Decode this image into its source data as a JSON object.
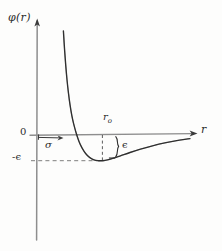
{
  "figure": {
    "kind": "hand-drawn-plot",
    "background_color": "#fdfdfc",
    "ink_color": "#2b2b2b",
    "axis_color": "#8a8a8a"
  },
  "labels": {
    "y_axis": "φ(r)",
    "x_axis": "r",
    "origin": "0",
    "sigma": "σ",
    "r_zero": "r",
    "r_zero_subscript": "o",
    "epsilon_depth": "ϵ",
    "neg_epsilon": "-ϵ"
  },
  "chart_data": {
    "type": "line",
    "title": "",
    "xlabel": "r",
    "ylabel": "φ(r)",
    "grid": false,
    "legend": null,
    "xlim": [
      0,
      5.2
    ],
    "ylim": [
      -1.6,
      4.2
    ],
    "annotations": [
      {
        "name": "sigma",
        "label": "σ",
        "type": "horizontal-arrow",
        "x_from": 0,
        "x_to": 0.78,
        "y": 0,
        "meaning": "distance at which potential is zero"
      },
      {
        "name": "r_zero",
        "label": "r₀",
        "type": "tick-label",
        "x": 2.18,
        "y": 0,
        "meaning": "separation at potential minimum"
      },
      {
        "name": "epsilon",
        "label": "ϵ",
        "type": "vertical-brace",
        "x": 2.18,
        "y_from": 0,
        "y_to": -1.0,
        "meaning": "well depth"
      },
      {
        "name": "neg_epsilon",
        "label": "-ϵ",
        "type": "axis-value",
        "x": 0,
        "y": -1.0,
        "meaning": "minimum value of the potential"
      },
      {
        "name": "epsilon_guide",
        "type": "dashed-horizontal",
        "y": -1.0,
        "x_from": 0,
        "x_to": 2.25
      },
      {
        "name": "r_zero_guide",
        "type": "dashed-vertical",
        "x": 2.18,
        "y_from": 0,
        "y_to": -1.0
      }
    ],
    "series": [
      {
        "name": "phi(r)",
        "x": [
          0.88,
          0.92,
          0.96,
          1.0,
          1.05,
          1.1,
          1.16,
          1.22,
          1.3,
          1.4,
          1.5,
          1.62,
          1.75,
          1.9,
          2.05,
          2.18,
          2.35,
          2.55,
          2.8,
          3.1,
          3.45,
          3.85,
          4.3,
          4.75,
          5.1
        ],
        "y": [
          4.05,
          3.3,
          2.68,
          2.15,
          1.62,
          1.18,
          0.76,
          0.44,
          0.1,
          -0.25,
          -0.5,
          -0.72,
          -0.87,
          -0.97,
          -1.0,
          -1.0,
          -0.97,
          -0.9,
          -0.8,
          -0.68,
          -0.55,
          -0.42,
          -0.3,
          -0.2,
          -0.14
        ]
      }
    ]
  }
}
